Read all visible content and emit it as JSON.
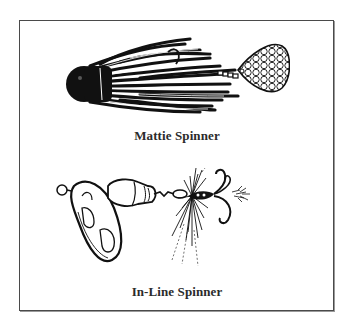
{
  "figure": {
    "items": [
      {
        "label": "Mattie Spinner",
        "icon": "mattie-spinner-illustration"
      },
      {
        "label": "In-Line Spinner",
        "icon": "in-line-spinner-illustration"
      }
    ]
  },
  "colors": {
    "ink": "#111111",
    "border": "#4a4a4a",
    "background": "#ffffff"
  }
}
